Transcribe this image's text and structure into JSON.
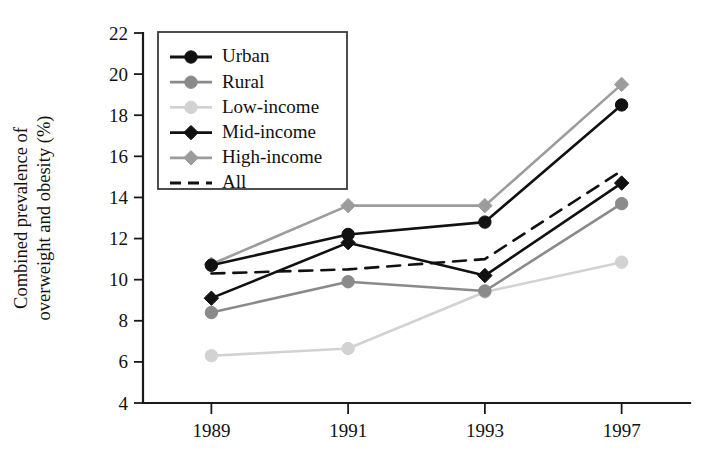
{
  "chart_data": {
    "type": "line",
    "title": "",
    "xlabel": "",
    "ylabel": "Combined prevalence of overweight and obesity (%)",
    "categories": [
      "1989",
      "1991",
      "1993",
      "1997"
    ],
    "x_tick_labels": [
      "1989",
      "1991",
      "1993",
      "1997"
    ],
    "y_tick_labels": [
      "4",
      "6",
      "8",
      "10",
      "12",
      "14",
      "16",
      "18",
      "20",
      "22"
    ],
    "y_ticks": [
      4,
      6,
      8,
      10,
      12,
      14,
      16,
      18,
      20,
      22
    ],
    "ylim": [
      4,
      22
    ],
    "grid": false,
    "legend_position": "upper-left-inside",
    "series": [
      {
        "name": "Urban",
        "values": [
          10.7,
          12.2,
          12.8,
          18.5
        ],
        "color": "#111111",
        "marker": "circle",
        "line_style": "solid"
      },
      {
        "name": "Rural",
        "values": [
          8.4,
          9.9,
          9.45,
          13.7
        ],
        "color": "#8a8a8a",
        "marker": "circle",
        "line_style": "solid"
      },
      {
        "name": "Low-income",
        "values": [
          6.3,
          6.65,
          9.4,
          10.85
        ],
        "color": "#d2d2d2",
        "marker": "circle",
        "line_style": "solid"
      },
      {
        "name": "Mid-income",
        "values": [
          9.1,
          11.8,
          10.2,
          14.7
        ],
        "color": "#111111",
        "marker": "diamond",
        "line_style": "solid"
      },
      {
        "name": "High-income",
        "values": [
          10.75,
          13.6,
          13.6,
          19.5
        ],
        "color": "#9c9c9c",
        "marker": "diamond",
        "line_style": "solid"
      },
      {
        "name": "All",
        "values": [
          10.3,
          10.5,
          11.0,
          15.3
        ],
        "color": "#111111",
        "marker": "none",
        "line_style": "dashed"
      }
    ]
  },
  "legend": {
    "items": [
      {
        "label": "Urban"
      },
      {
        "label": "Rural"
      },
      {
        "label": "Low-income"
      },
      {
        "label": "Mid-income"
      },
      {
        "label": "High-income"
      },
      {
        "label": "All"
      }
    ]
  },
  "axes": {
    "y_axis_title": "Combined prevalence of overweight and obesity (%)"
  }
}
